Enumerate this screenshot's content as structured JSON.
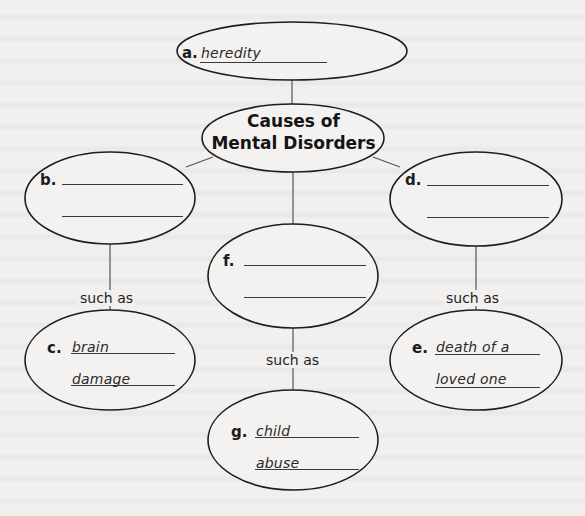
{
  "diagram": {
    "type": "concept-map",
    "center": {
      "title_line1": "Causes of",
      "title_line2": "Mental Disorders"
    },
    "nodes": {
      "a": {
        "letter": "a.",
        "line1": "heredity",
        "line2": ""
      },
      "b": {
        "letter": "b.",
        "line1": "",
        "line2": ""
      },
      "c": {
        "letter": "c.",
        "line1": "brain",
        "line2": "damage"
      },
      "d": {
        "letter": "d.",
        "line1": "",
        "line2": ""
      },
      "e": {
        "letter": "e.",
        "line1": "death of a",
        "line2": "loved one"
      },
      "f": {
        "letter": "f.",
        "line1": "",
        "line2": ""
      },
      "g": {
        "letter": "g.",
        "line1": "child",
        "line2": "abuse"
      }
    },
    "connectors": {
      "b_to_c": "such as",
      "d_to_e": "such as",
      "f_to_g": "such as"
    },
    "colors": {
      "stroke": "#1e1e1e",
      "background": "#f1f0ee",
      "text": "#1c1c1c"
    }
  }
}
